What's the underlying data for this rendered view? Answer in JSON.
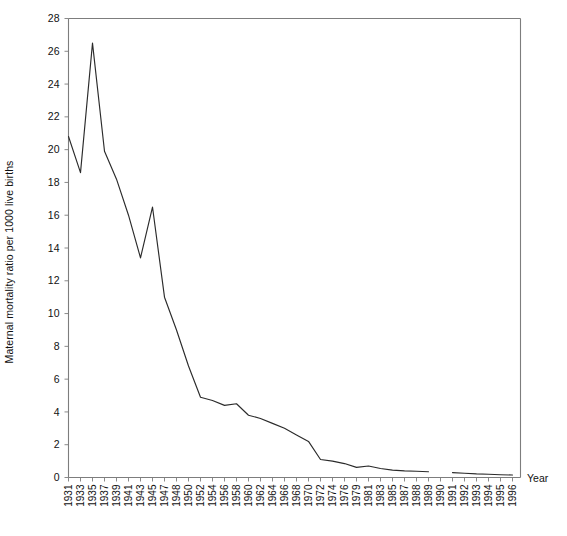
{
  "chart_data": {
    "type": "line",
    "title": "",
    "xlabel": "Year",
    "ylabel": "Maternal mortality ratio per 1000 live births",
    "ylim": [
      0,
      28
    ],
    "ytick_step": 2,
    "yticks": [
      0,
      2,
      4,
      6,
      8,
      10,
      12,
      14,
      16,
      18,
      20,
      22,
      24,
      26,
      28
    ],
    "grid": false,
    "legend": null,
    "categories": [
      "1931",
      "1933",
      "1935",
      "1937",
      "1939",
      "1941",
      "1943",
      "1945",
      "1947",
      "1948",
      "1950",
      "1952",
      "1954",
      "1956",
      "1958",
      "1960",
      "1962",
      "1964",
      "1966",
      "1968",
      "1970",
      "1972",
      "1974",
      "1976",
      "1979",
      "1981",
      "1983",
      "1985",
      "1987",
      "1988",
      "1989",
      "1990",
      "1991",
      "1992",
      "1993",
      "1994",
      "1995",
      "1996"
    ],
    "series": [
      {
        "name": "Maternal mortality ratio",
        "values": [
          20.8,
          18.6,
          26.5,
          19.9,
          18.2,
          16.0,
          13.4,
          16.5,
          11.0,
          9.0,
          6.8,
          4.9,
          4.7,
          4.4,
          4.5,
          3.8,
          3.6,
          3.3,
          3.0,
          2.6,
          2.2,
          1.1,
          1.0,
          0.85,
          0.62,
          0.7,
          0.55,
          0.45,
          0.4,
          0.38,
          0.35,
          null,
          0.3,
          0.26,
          0.22,
          0.2,
          0.17,
          0.15
        ]
      }
    ],
    "break_note": "Series discontinuity between 1989 and 1990",
    "colors": {
      "line": "#2b2b2b",
      "axis": "#7d7d7d",
      "background": "#ffffff",
      "text": "#111111"
    }
  }
}
